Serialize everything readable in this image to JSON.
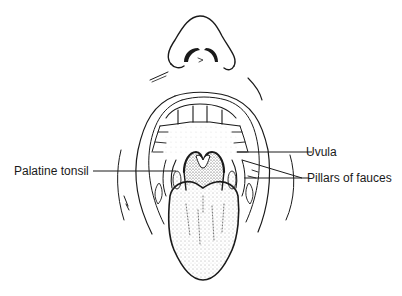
{
  "diagram": {
    "labels": {
      "palatine_tonsil": "Palatine tonsil",
      "uvula": "Uvula",
      "pillars_of_fauces": "Pillars of fauces"
    },
    "colors": {
      "ink": "#1a1a1a",
      "background": "#ffffff"
    }
  }
}
